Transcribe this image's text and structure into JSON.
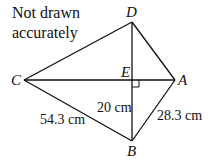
{
  "note": {
    "line1": "Not drawn",
    "line2": "accurately"
  },
  "points": {
    "A": {
      "label": "A",
      "x": 175,
      "y": 80
    },
    "B": {
      "label": "B",
      "x": 132,
      "y": 141
    },
    "C": {
      "label": "C",
      "x": 24,
      "y": 80
    },
    "D": {
      "label": "D",
      "x": 132,
      "y": 22
    },
    "E": {
      "label": "E",
      "x": 132,
      "y": 80
    }
  },
  "lengths": {
    "EB": "20 cm",
    "CB": "54.3 cm",
    "AB": "28.3 cm"
  },
  "right_angle_at": "E"
}
